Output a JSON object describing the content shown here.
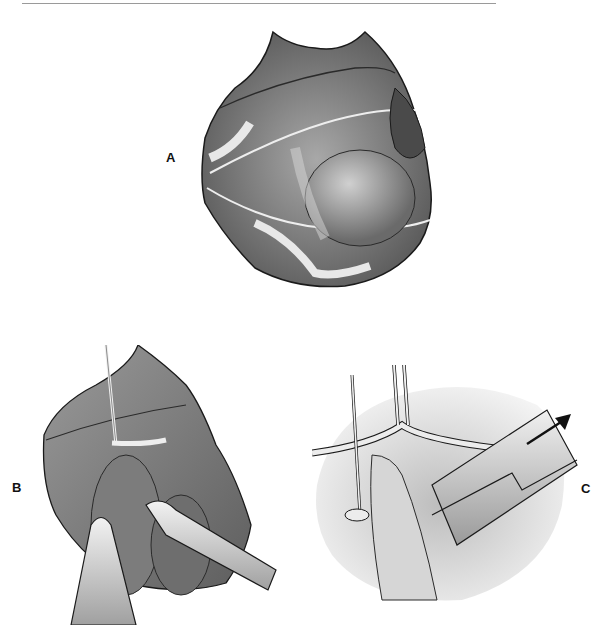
{
  "figure": {
    "panels": [
      {
        "id": "A",
        "label": "A",
        "description": "Exposed surgical field with vessels and retracted tissue edges"
      },
      {
        "id": "B",
        "label": "B",
        "description": "Vessel loop and clamp placement with forceps"
      },
      {
        "id": "C",
        "label": "C",
        "description": "Close-up with clamp withdrawn in direction of arrow"
      }
    ]
  },
  "colors": {
    "tissue_dark": "#5a5a5a",
    "tissue_mid": "#8a8a8a",
    "tissue_light": "#c8c8c8",
    "outline": "#1a1a1a",
    "background": "#ffffff"
  }
}
